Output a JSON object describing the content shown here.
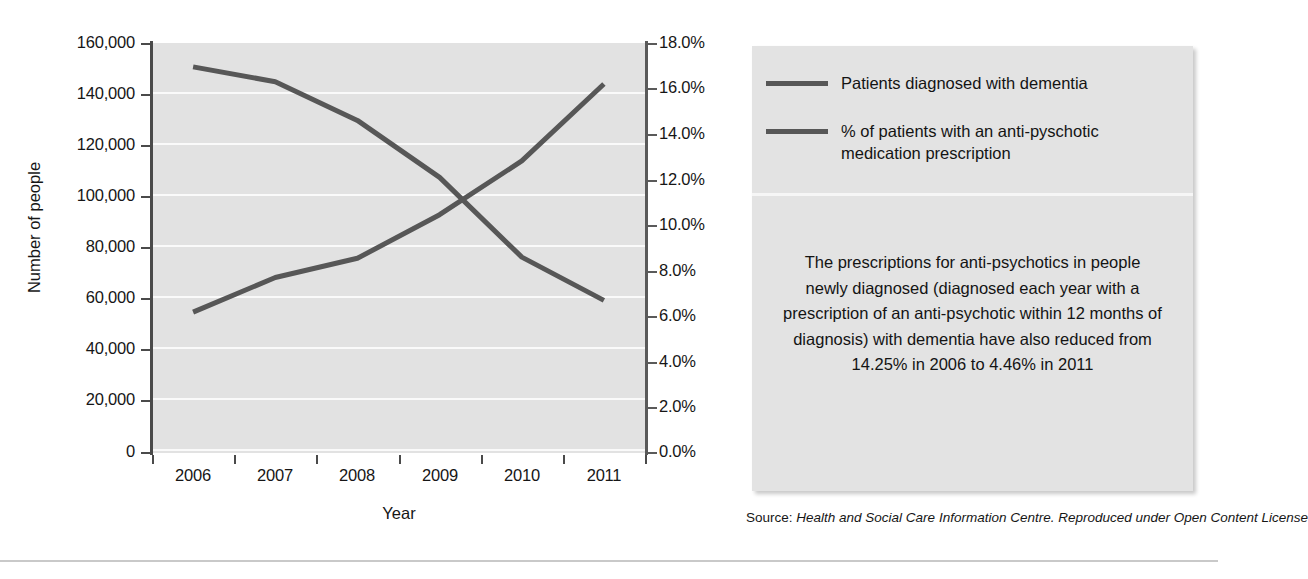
{
  "chart_data": {
    "type": "line",
    "title": "",
    "xlabel": "Year",
    "ylabel": "Number of people",
    "y2label": "",
    "categories": [
      "2006",
      "2007",
      "2008",
      "2009",
      "2010",
      "2011"
    ],
    "ylim": [
      0,
      160000
    ],
    "y2lim": [
      0,
      18
    ],
    "yticks": [
      "0",
      "20,000",
      "40,000",
      "60,000",
      "80,000",
      "100,000",
      "120,000",
      "140,000",
      "160,000"
    ],
    "y2ticks": [
      "0.0%",
      "2.0%",
      "4.0%",
      "6.0%",
      "8.0%",
      "10.0%",
      "12.0%",
      "14.0%",
      "16.0%",
      "18.0%"
    ],
    "grid": true,
    "legend_position": "right-panel",
    "series": [
      {
        "name": "Patients diagnosed with dementia",
        "axis": "right",
        "units": "percent",
        "color": "#575757",
        "values": [
          16.95,
          16.3,
          14.6,
          12.1,
          8.6,
          6.7
        ]
      },
      {
        "name": "% of patients with an anti-pyschotic medication prescription",
        "axis": "left",
        "units": "people",
        "color": "#575757",
        "values": [
          55000,
          68500,
          76000,
          93000,
          114000,
          144000
        ]
      }
    ]
  },
  "legend": {
    "items": [
      {
        "label": "Patients diagnosed with dementia",
        "color": "#575757"
      },
      {
        "label": "% of patients with an anti-pyschotic medication prescription",
        "color": "#575757"
      }
    ]
  },
  "panel": {
    "note": "The prescriptions for anti-psychotics in people newly diagnosed (diagnosed each year with a prescription of an anti-psychotic within 12 months of diagnosis) with dementia have also reduced from 14.25% in 2006 to 4.46% in 2011"
  },
  "source": {
    "label": "Source:",
    "body": "Health and Social Care Information Centre. Reproduced under Open Content License"
  },
  "axes": {
    "y_title": "Number of people",
    "x_title": "Year"
  }
}
